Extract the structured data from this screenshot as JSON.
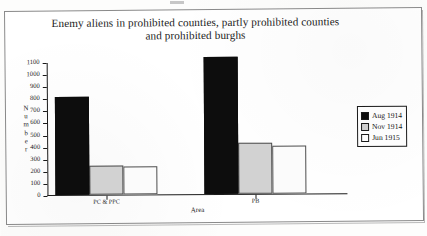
{
  "chart_data": {
    "type": "bar",
    "title": "Enemy aliens in prohibited counties, partly prohibited counties",
    "title_line2": "and prohibited burghs",
    "xlabel": "Area",
    "ylabel_letters": [
      "N",
      "u",
      "m",
      "b",
      "e",
      "r"
    ],
    "ylabel": "Number",
    "categories": [
      "PC & PPC",
      "PB"
    ],
    "ylim": [
      0,
      1100
    ],
    "ytick_values": [
      0,
      100,
      200,
      300,
      400,
      500,
      600,
      700,
      800,
      900,
      1000,
      1100
    ],
    "ytick_labels": [
      "0",
      "100",
      "200",
      "300",
      "400",
      "500",
      "600",
      "700",
      "800",
      "900",
      "1000",
      "1100"
    ],
    "grid": false,
    "legend_position": "right",
    "series": [
      {
        "name": "Aug 1914",
        "color": "#0d0d0d",
        "values": [
          810,
          1130
        ]
      },
      {
        "name": "Nov 1914",
        "color": "#d2d2d2",
        "values": [
          240,
          420
        ]
      },
      {
        "name": "Jun 1915",
        "color": "#fbfbfb",
        "values": [
          230,
          400
        ]
      }
    ]
  },
  "legend": {
    "items": [
      {
        "label": "Aug 1914"
      },
      {
        "label": "Nov 1914"
      },
      {
        "label": "Jun 1915"
      }
    ]
  }
}
